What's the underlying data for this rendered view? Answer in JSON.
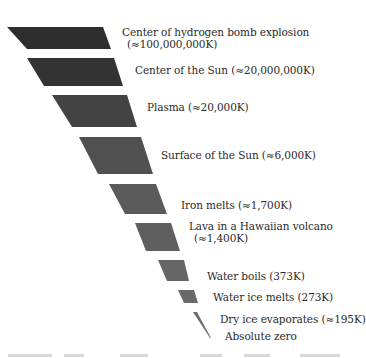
{
  "diagram": {
    "title": "",
    "levels": [
      {
        "label_line1": "Center of hydrogen bomb explosion",
        "label_line2": "(≈100,000,000K)",
        "temperature_k": 100000000,
        "shape": [
          [
            7,
            27
          ],
          [
            103,
            27
          ],
          [
            111,
            49
          ],
          [
            27,
            49
          ]
        ],
        "color": "#2e2e2e",
        "label_pos": [
          122,
          26
        ]
      },
      {
        "label_line1": "Center of the Sun (≈20,000,000K)",
        "label_line2": "",
        "temperature_k": 20000000,
        "shape": [
          [
            27,
            58
          ],
          [
            114,
            58
          ],
          [
            123,
            86
          ],
          [
            44,
            86
          ]
        ],
        "color": "#333333",
        "label_pos": [
          135,
          64
        ]
      },
      {
        "label_line1": "Plasma (≈20,000K)",
        "label_line2": "",
        "temperature_k": 20000,
        "shape": [
          [
            52,
            95
          ],
          [
            127,
            95
          ],
          [
            137,
            127
          ],
          [
            72,
            127
          ]
        ],
        "color": "#434343",
        "label_pos": [
          147,
          101
        ]
      },
      {
        "label_line1": "Surface of the Sun (≈6,000K)",
        "label_line2": "",
        "temperature_k": 6000,
        "shape": [
          [
            79,
            137
          ],
          [
            141,
            137
          ],
          [
            153,
            174
          ],
          [
            98,
            174
          ]
        ],
        "color": "#505050",
        "label_pos": [
          161,
          149
        ]
      },
      {
        "label_line1": "Iron melts (≈1,700K)",
        "label_line2": "",
        "temperature_k": 1700,
        "shape": [
          [
            109,
            184
          ],
          [
            156,
            184
          ],
          [
            167,
            214
          ],
          [
            125,
            214
          ]
        ],
        "color": "#5a5a5a",
        "label_pos": [
          181,
          199
        ]
      },
      {
        "label_line1": "Lava in a Hawaiian volcano",
        "label_line2": "(≈1,400K)",
        "temperature_k": 1400,
        "shape": [
          [
            135,
            223
          ],
          [
            171,
            223
          ],
          [
            180,
            251
          ],
          [
            146,
            251
          ]
        ],
        "color": "#5e5e5e",
        "label_pos": [
          189,
          220
        ]
      },
      {
        "label_line1": "Water boils (373K)",
        "label_line2": "",
        "temperature_k": 373,
        "shape": [
          [
            158,
            260
          ],
          [
            184,
            260
          ],
          [
            189,
            281
          ],
          [
            167,
            281
          ]
        ],
        "color": "#666666",
        "label_pos": [
          207,
          270
        ]
      },
      {
        "label_line1": "Water ice melts (273K)",
        "label_line2": "",
        "temperature_k": 273,
        "shape": [
          [
            178,
            290
          ],
          [
            194,
            290
          ],
          [
            198,
            303
          ],
          [
            184,
            303
          ]
        ],
        "color": "#6a6a6a",
        "label_pos": [
          213,
          291
        ]
      },
      {
        "label_line1": "Dry ice evaporates (≈195K)",
        "label_line2": "",
        "temperature_k": 195,
        "shape": [
          [
            193,
            312
          ],
          [
            197,
            312
          ],
          [
            211,
            338
          ],
          [
            210,
            338
          ]
        ],
        "color": "#6e6e6e",
        "label_pos": [
          220,
          313
        ]
      },
      {
        "label_line1": "Absolute zero",
        "label_line2": "",
        "temperature_k": 0,
        "shape": [],
        "color": "#6e6e6e",
        "label_pos": [
          225,
          330
        ]
      }
    ]
  }
}
